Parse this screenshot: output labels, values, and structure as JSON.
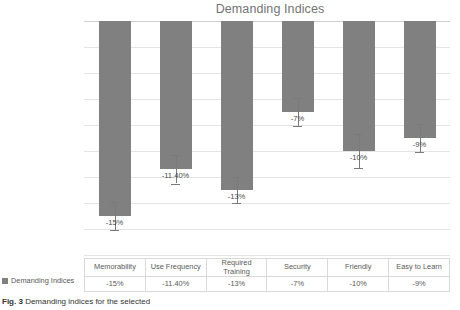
{
  "chart_data": {
    "type": "bar",
    "title": "Demanding Indices",
    "xlabel": "",
    "ylabel": "",
    "ylim": [
      -18,
      0
    ],
    "ytick_step": 2,
    "grid": true,
    "legend_position": "data-table-row",
    "orientation": "vertical",
    "bar_color": "#808080",
    "categories": [
      "Memorability",
      "Use Frequency",
      "Required Training",
      "Security",
      "Friendly",
      "Easy to Learn"
    ],
    "series": [
      {
        "name": "Demanding Indices",
        "values": [
          -15,
          -11.4,
          -13,
          -7,
          -10,
          -9
        ],
        "labels": [
          "-15%",
          "-11.40%",
          "-13%",
          "-7%",
          "-10%",
          "-9%"
        ],
        "errors": [
          1.1,
          1.1,
          1.0,
          1.1,
          1.3,
          1.1
        ]
      }
    ],
    "ytick_labels": [
      "0%",
      "-2%",
      "-4%",
      "-6%",
      "-8%",
      "-10%",
      "-12%",
      "-14%",
      "-16%",
      "-18%"
    ]
  },
  "table": {
    "row_label": "Demanding Indices",
    "headers": [
      "Memorability",
      "Use Frequency",
      "Required Training",
      "Security",
      "Friendly",
      "Easy to Learn"
    ],
    "values": [
      "-15%",
      "-11.40%",
      "-13%",
      "-7%",
      "-10%",
      "-9%"
    ]
  },
  "caption": {
    "label": "Fig. 3",
    "text": "Demanding indices for the selected"
  },
  "colors": {
    "bar": "#808080",
    "grid": "#e4e4e4",
    "title": "#737373",
    "text": "#595959"
  }
}
